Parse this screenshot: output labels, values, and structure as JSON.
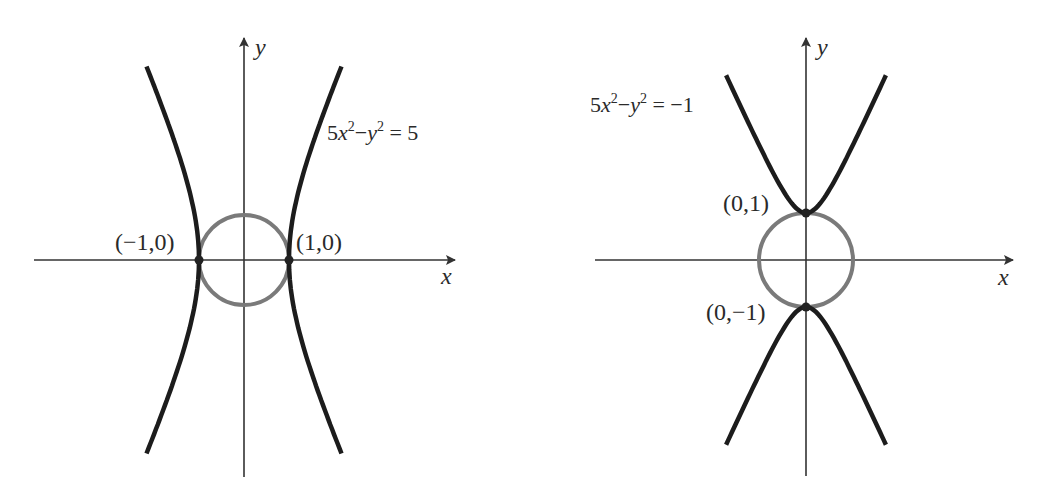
{
  "colors": {
    "background": "#ffffff",
    "axis": "#333333",
    "hyperbola": "#1c1c1c",
    "circle": "#7a7a7a",
    "point": "#222222",
    "text": "#2a2a2a"
  },
  "figures": [
    {
      "id": "left",
      "equation": "5x²−y² = 5",
      "equation_parts": {
        "coef": "5",
        "x": "x",
        "sup1": "2",
        "minus": "−",
        "y": "y",
        "sup2": "2",
        "rhs": " = 5"
      },
      "curve_type": "hyperbola-horizontal",
      "axis_labels": {
        "x": "x",
        "y": "y"
      },
      "points": [
        {
          "label": "(−1,0)",
          "x": -1,
          "y": 0
        },
        {
          "label": "(1,0)",
          "x": 1,
          "y": 0
        }
      ],
      "circle": {
        "center": [
          0,
          0
        ],
        "radius": 1
      },
      "origin_px": [
        244,
        260
      ],
      "scale_px": 45,
      "x_axis_px": [
        34,
        455
      ],
      "y_axis_px": [
        38,
        477
      ],
      "curve_y_range": [
        -4.3,
        4.3
      ]
    },
    {
      "id": "right",
      "equation": "5x²−y² = −1",
      "equation_parts": {
        "coef": "5",
        "x": "x",
        "sup1": "2",
        "minus": "−",
        "y": "y",
        "sup2": "2",
        "rhs": " = −1"
      },
      "curve_type": "hyperbola-vertical",
      "axis_labels": {
        "x": "x",
        "y": "y"
      },
      "points": [
        {
          "label": "(0,1)",
          "x": 0,
          "y": 1
        },
        {
          "label": "(0,−1)",
          "x": 0,
          "y": -1
        }
      ],
      "circle": {
        "center": [
          0,
          0
        ],
        "radius": 1
      },
      "origin_px": [
        806,
        260
      ],
      "scale_px": 47,
      "x_axis_px": [
        595,
        1013
      ],
      "y_axis_px": [
        38,
        476
      ],
      "curve_x_range": [
        -1.7,
        1.7
      ]
    }
  ]
}
